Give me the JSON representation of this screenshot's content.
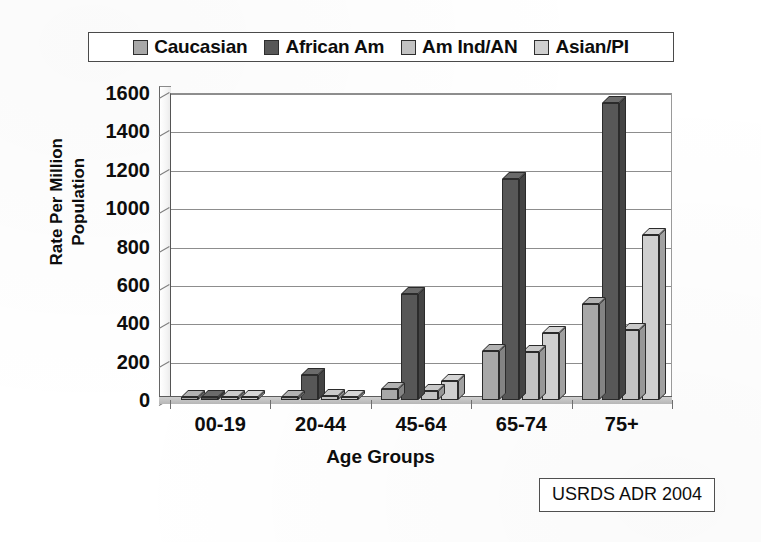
{
  "source_note": "USRDS ADR 2004",
  "legend": {
    "entries": [
      {
        "label": "Caucasian",
        "color": "#a8a8a8",
        "icon": "legend-swatch-icon"
      },
      {
        "label": "African Am",
        "color": "#575757",
        "icon": "legend-swatch-icon"
      },
      {
        "label": "Am Ind/AN",
        "color": "#c2c2c2",
        "icon": "legend-swatch-icon"
      },
      {
        "label": "Asian/PI",
        "color": "#cfcfcf",
        "icon": "legend-swatch-icon"
      }
    ]
  },
  "chart_data": {
    "type": "bar",
    "title": "",
    "xlabel": "Age Groups",
    "ylabel": "Rate Per Million Population",
    "ylabel_line1": "Rate Per Million",
    "ylabel_line2": "Population",
    "categories": [
      "00-19",
      "20-44",
      "45-64",
      "65-74",
      "75+"
    ],
    "ylim": [
      0,
      1600
    ],
    "yticks": [
      0,
      200,
      400,
      600,
      800,
      1000,
      1200,
      1400,
      1600
    ],
    "ytick_labels": [
      "0",
      "200",
      "400",
      "600",
      "800",
      "1000",
      "1200",
      "1400",
      "1600"
    ],
    "grid": true,
    "legend_position": "top",
    "style": "3d-columns",
    "series": [
      {
        "name": "Caucasian",
        "color": "#a8a8a8",
        "values": [
          8,
          15,
          55,
          255,
          500
        ]
      },
      {
        "name": "African Am",
        "color": "#575757",
        "values": [
          12,
          130,
          550,
          1150,
          1550
        ]
      },
      {
        "name": "Am Ind/AN",
        "color": "#c2c2c2",
        "values": [
          6,
          20,
          45,
          250,
          365
        ]
      },
      {
        "name": "Asian/PI",
        "color": "#cfcfcf",
        "values": [
          5,
          15,
          100,
          350,
          860
        ]
      }
    ]
  }
}
